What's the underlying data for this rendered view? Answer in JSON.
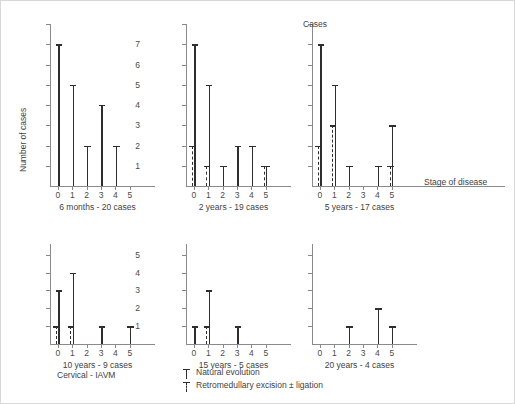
{
  "figure": {
    "group_title": "Cervical - IAVM",
    "y_axis_title": "Number of cases",
    "x_axis_title": "Stage of disease",
    "top_right_axis_label": "Cases"
  },
  "legend": {
    "position": "bottom-center",
    "items": [
      {
        "label": "Natural evolution",
        "style": "solid",
        "icon": "solid-bar-icon"
      },
      {
        "label": "Retromedullary excision ± ligation",
        "style": "dashed",
        "icon": "dashed-bar-icon"
      }
    ]
  },
  "chart_data": {
    "type": "bar",
    "title": "Cervical - IAVM",
    "xlabel": "Stage of disease",
    "ylabel": "Number of cases",
    "categories": [
      "0",
      "1",
      "2",
      "3",
      "4",
      "5"
    ],
    "ylim": [
      0,
      8
    ],
    "yticks": [
      1,
      2,
      3,
      4,
      5,
      6,
      7,
      8
    ],
    "ytick_labels_shown": [
      "1",
      "2",
      "3",
      "4",
      "5",
      "6",
      "7"
    ],
    "grid": false,
    "legend_position": "bottom-center",
    "panels": [
      {
        "caption": "6 months - 20 cases",
        "ymax": 8,
        "ytick_labels": [
          "1",
          "2",
          "3",
          "4",
          "5",
          "6",
          "7"
        ],
        "series": [
          {
            "name": "Natural evolution",
            "style": "solid",
            "values": [
              7,
              5,
              2,
              4,
              2,
              0
            ]
          },
          {
            "name": "Retromedullary excision ± ligation",
            "style": "dashed",
            "values": [
              0,
              0,
              0,
              0,
              0,
              0
            ]
          }
        ]
      },
      {
        "caption": "2 years - 19 cases",
        "ymax": 8,
        "ytick_labels": [],
        "series": [
          {
            "name": "Natural evolution",
            "style": "solid",
            "values": [
              7,
              5,
              1,
              2,
              2,
              1
            ]
          },
          {
            "name": "Retromedullary excision ± ligation",
            "style": "dashed",
            "values": [
              2,
              1,
              0,
              0,
              0,
              1
            ]
          }
        ]
      },
      {
        "caption": "5 years - 17 cases",
        "ymax": 8,
        "ytick_labels": [],
        "series": [
          {
            "name": "Natural evolution",
            "style": "solid",
            "values": [
              7,
              5,
              1,
              0,
              1,
              3
            ]
          },
          {
            "name": "Retromedullary excision ± ligation",
            "style": "dashed",
            "values": [
              2,
              3,
              0,
              0,
              0,
              1
            ]
          }
        ]
      },
      {
        "caption": "10 years - 9 cases",
        "ymax": 5.6,
        "ytick_labels": [
          "1",
          "2",
          "3",
          "4",
          "5"
        ],
        "series": [
          {
            "name": "Natural evolution",
            "style": "solid",
            "values": [
              3,
              4,
              0,
              1,
              0,
              1
            ]
          },
          {
            "name": "Retromedullary excision ± ligation",
            "style": "dashed",
            "values": [
              1,
              1,
              0,
              0,
              0,
              0
            ]
          }
        ]
      },
      {
        "caption": "15 years - 5 cases",
        "ymax": 5.6,
        "ytick_labels": [],
        "series": [
          {
            "name": "Natural evolution",
            "style": "solid",
            "values": [
              1,
              3,
              0,
              1,
              0,
              0
            ]
          },
          {
            "name": "Retromedullary excision ± ligation",
            "style": "dashed",
            "values": [
              0,
              1,
              0,
              0,
              0,
              0
            ]
          }
        ]
      },
      {
        "caption": "20 years - 4 cases",
        "ymax": 5.6,
        "ytick_labels": [],
        "series": [
          {
            "name": "Natural evolution",
            "style": "solid",
            "values": [
              0,
              0,
              1,
              0,
              2,
              1
            ]
          },
          {
            "name": "Retromedullary excision ± ligation",
            "style": "dashed",
            "values": [
              0,
              0,
              0,
              0,
              0,
              0
            ]
          }
        ]
      }
    ]
  }
}
